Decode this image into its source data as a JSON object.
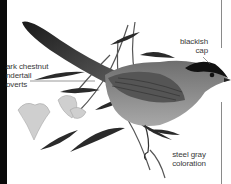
{
  "illustration": {
    "subject": "bird perched on flowering branch",
    "colors": {
      "left_band": "#0a0a0a",
      "divider_line": "#8a8a8a",
      "label_text": "#3a3a3a",
      "bird_body": "#8c8c8c",
      "bird_dark": "#222222"
    }
  },
  "labels": {
    "undertail": {
      "line1": "ark chestnut",
      "line2": "ndertail",
      "line3": "overts"
    },
    "cap": {
      "line1": "blackish",
      "line2": "cap"
    },
    "coloration": {
      "line1": "steel gray",
      "line2": "coloration"
    }
  }
}
